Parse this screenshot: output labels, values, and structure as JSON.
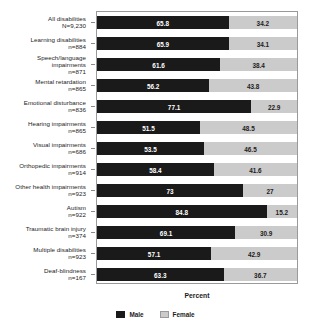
{
  "chart_data": {
    "type": "bar",
    "orientation": "horizontal",
    "stacked": true,
    "title": "",
    "xlabel": "Percent",
    "ylabel": "",
    "xlim": [
      0,
      100
    ],
    "grid": false,
    "legend_position": "bottom",
    "categories": [
      "All disabilities",
      "Learning disabilities",
      "Speech/language impairments",
      "Mental retardation",
      "Emotional disturbance",
      "Hearing impairments",
      "Visual impairments",
      "Orthopedic impairments",
      "Other health impairments",
      "Autism",
      "Traumatic brain injury",
      "Multiple disabilities",
      "Deaf-blindness"
    ],
    "category_lines": [
      [
        "All disabilities"
      ],
      [
        "Learning disabilities"
      ],
      [
        "Speech/language",
        "impairments"
      ],
      [
        "Mental retardation"
      ],
      [
        "Emotional disturbance"
      ],
      [
        "Hearing impairments"
      ],
      [
        "Visual impairments"
      ],
      [
        "Orthopedic impairments"
      ],
      [
        "Other health impairments"
      ],
      [
        "Autism"
      ],
      [
        "Traumatic brain injury"
      ],
      [
        "Multiple disabilities"
      ],
      [
        "Deaf-blindness"
      ]
    ],
    "sample_sizes": [
      "N=9,230",
      "n=884",
      "n=871",
      "n=865",
      "n=836",
      "n=865",
      "n=686",
      "n=914",
      "n=923",
      "n=922",
      "n=374",
      "n=923",
      "n=167"
    ],
    "series": [
      {
        "name": "Male",
        "color": "#1a1a1a",
        "values": [
          65.8,
          65.9,
          61.6,
          56.2,
          77.1,
          51.5,
          53.5,
          58.4,
          73,
          84.8,
          69.1,
          57.1,
          63.3
        ],
        "labels": [
          "65.8",
          "65.9",
          "61.6",
          "56.2",
          "77.1",
          "51.5",
          "53.5",
          "58.4",
          "73",
          "84.8",
          "69.1",
          "57.1",
          "63.3"
        ]
      },
      {
        "name": "Female",
        "color": "#cbcbcb",
        "values": [
          34.2,
          34.1,
          38.4,
          43.8,
          22.9,
          48.5,
          46.5,
          41.6,
          27,
          15.2,
          30.9,
          42.9,
          36.7
        ],
        "labels": [
          "34.2",
          "34.1",
          "38.4",
          "43.8",
          "22.9",
          "48.5",
          "46.5",
          "41.6",
          "27",
          "15.2",
          "30.9",
          "42.9",
          "36.7"
        ]
      }
    ]
  },
  "legend": {
    "items": [
      {
        "label": "Male",
        "color": "#1a1a1a"
      },
      {
        "label": "Female",
        "color": "#cbcbcb"
      }
    ]
  },
  "axis": {
    "x_title": "Percent"
  }
}
